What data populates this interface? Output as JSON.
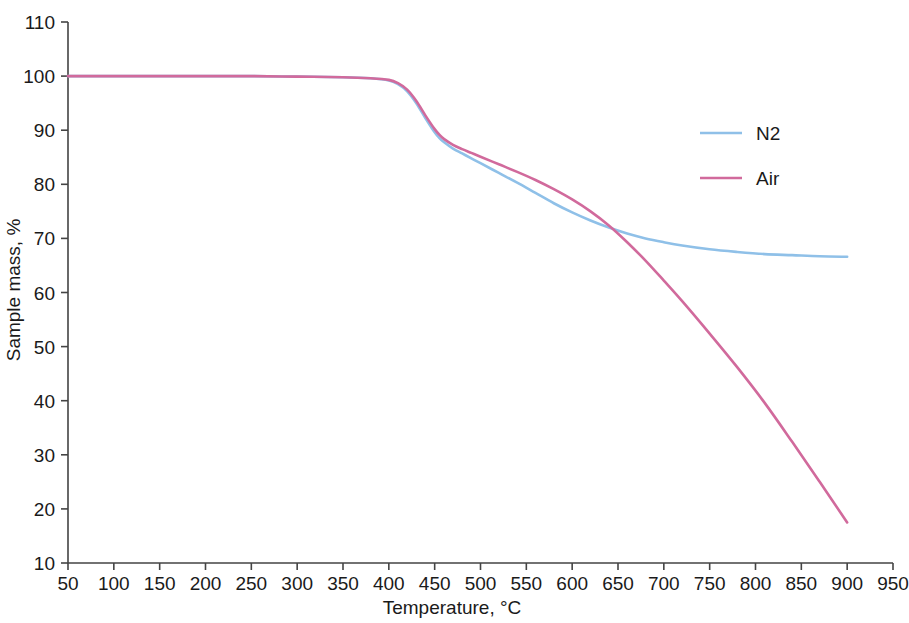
{
  "chart_data": {
    "type": "line",
    "title": "",
    "xlabel": "Temperature, °C",
    "ylabel": "Sample mass, %",
    "xlim": [
      50,
      950
    ],
    "ylim": [
      10,
      110
    ],
    "xticks": [
      50,
      100,
      150,
      200,
      250,
      300,
      350,
      400,
      450,
      500,
      550,
      600,
      650,
      700,
      750,
      800,
      850,
      900,
      950
    ],
    "yticks": [
      10,
      20,
      30,
      40,
      50,
      60,
      70,
      80,
      90,
      100,
      110
    ],
    "xtick_labels": [
      "50",
      "100",
      "150",
      "200",
      "250",
      "300",
      "350",
      "400",
      "450",
      "500",
      "550",
      "600",
      "650",
      "700",
      "750",
      "800",
      "850",
      "900",
      "950"
    ],
    "ytick_labels": [
      "10",
      "20",
      "30",
      "40",
      "50",
      "60",
      "70",
      "80",
      "90",
      "100",
      "110"
    ],
    "grid": false,
    "legend_position": "upper right",
    "series": [
      {
        "name": "N2",
        "color": "#8FC0E8",
        "x": [
          50,
          100,
          150,
          200,
          250,
          300,
          350,
          380,
          400,
          410,
          420,
          430,
          440,
          450,
          455,
          460,
          470,
          480,
          490,
          500,
          520,
          540,
          560,
          580,
          600,
          620,
          640,
          660,
          680,
          700,
          720,
          750,
          780,
          810,
          840,
          870,
          900
        ],
        "y": [
          100.0,
          100.0,
          100.0,
          100.0,
          100.0,
          99.9,
          99.8,
          99.6,
          99.2,
          98.5,
          97.2,
          95.0,
          92.2,
          89.6,
          88.6,
          87.8,
          86.6,
          85.7,
          84.8,
          83.9,
          82.1,
          80.3,
          78.4,
          76.5,
          74.8,
          73.3,
          72.0,
          70.9,
          70.0,
          69.3,
          68.7,
          68.0,
          67.5,
          67.1,
          66.9,
          66.7,
          66.6
        ]
      },
      {
        "name": "Air",
        "color": "#D16A9C",
        "x": [
          50,
          100,
          150,
          200,
          250,
          300,
          350,
          380,
          400,
          410,
          420,
          430,
          440,
          450,
          455,
          460,
          470,
          480,
          490,
          500,
          520,
          540,
          560,
          580,
          600,
          620,
          640,
          660,
          680,
          700,
          720,
          750,
          780,
          810,
          840,
          870,
          900
        ],
        "y": [
          100.0,
          100.0,
          100.0,
          100.0,
          100.0,
          99.9,
          99.8,
          99.6,
          99.3,
          98.7,
          97.5,
          95.4,
          92.7,
          90.2,
          89.2,
          88.4,
          87.3,
          86.5,
          85.8,
          85.1,
          83.7,
          82.3,
          80.8,
          79.1,
          77.2,
          75.0,
          72.4,
          69.3,
          65.9,
          62.2,
          58.4,
          52.4,
          46.2,
          39.6,
          32.4,
          25.0,
          17.5
        ]
      }
    ],
    "annotations": []
  },
  "legend": {
    "items": [
      {
        "label": "N2",
        "color": "#8FC0E8"
      },
      {
        "label": "Air",
        "color": "#D16A9C"
      }
    ]
  },
  "axes": {
    "x_title": "Temperature, °C",
    "y_title": "Sample mass, %"
  }
}
